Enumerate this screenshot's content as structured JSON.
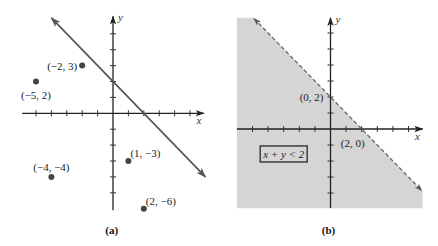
{
  "chart_data": [
    {
      "panel": "a",
      "type": "scatter",
      "title": "",
      "caption": "(a)",
      "xlabel": "x",
      "ylabel": "y",
      "xlim": [
        -5.9,
        5.9
      ],
      "ylim": [
        -6.1,
        6.1
      ],
      "grid": false,
      "xticks": [
        -5,
        -4,
        -3,
        -2,
        -1,
        1,
        2,
        3,
        4,
        5
      ],
      "yticks": [
        -5,
        -4,
        -3,
        -2,
        -1,
        1,
        2,
        3,
        4,
        5
      ],
      "points": [
        {
          "x": -2,
          "y": 3,
          "label": "(−2, 3)",
          "label_pos": "left"
        },
        {
          "x": -5,
          "y": 2,
          "label": "(−5, 2)",
          "label_pos": "below"
        },
        {
          "x": 1,
          "y": -3,
          "label": "(1, −3)",
          "label_pos": "upper-right"
        },
        {
          "x": -4,
          "y": -4,
          "label": "(−4, −4)",
          "label_pos": "above"
        },
        {
          "x": 2,
          "y": -6,
          "label": "(2, −6)",
          "label_pos": "upper-right"
        }
      ],
      "lines": [
        {
          "equation": "x + y = 2",
          "from": [
            -4,
            6
          ],
          "to": [
            6,
            -4
          ],
          "style": "solid",
          "arrows": "both",
          "color": "#555555"
        }
      ]
    },
    {
      "panel": "b",
      "type": "area",
      "title": "",
      "caption": "(b)",
      "xlabel": "x",
      "ylabel": "y",
      "xlim": [
        -6.0,
        5.9
      ],
      "ylim": [
        -4.95,
        6.95
      ],
      "grid": false,
      "xticks": [
        -5,
        -4,
        -3,
        -2,
        -1,
        1,
        2,
        3,
        4,
        5
      ],
      "yticks": [
        -4,
        -3,
        -2,
        -1,
        1,
        2,
        3,
        4,
        5,
        6
      ],
      "inequality": "x + y < 2",
      "shade_color": "#d5d5d5",
      "boundary": {
        "equation": "x + y = 2",
        "from": [
          -4.9,
          6.9
        ],
        "to": [
          5.85,
          -3.85
        ],
        "style": "dashed",
        "arrows": "both",
        "color": "#666666"
      },
      "points": [
        {
          "x": 0,
          "y": 2,
          "label": "(0, 2)",
          "label_pos": "left",
          "marker": false
        },
        {
          "x": 2,
          "y": 0,
          "label": "(2, 0)",
          "label_pos": "below",
          "marker": false
        }
      ],
      "annotations": [
        {
          "text": "x + y < 2",
          "x": -3.0,
          "y": -1.56,
          "boxed": true
        }
      ]
    }
  ]
}
